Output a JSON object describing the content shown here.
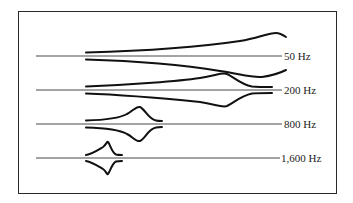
{
  "diagram": {
    "type": "traveling-wave-envelopes",
    "rows": [
      {
        "label": "50 Hz",
        "baseline_y": 56,
        "upper": "M86,52.5 C140,51 200,47 240,41 C258,38 268,33 276,33 C280,33 283,35 286,37",
        "lower": "M86,59.5 C140,61 190,66 220,71 C240,74 252,78 262,77 C270,76 278,74 286,70"
      },
      {
        "label": "200 Hz",
        "baseline_y": 90,
        "upper": "M86,86.5 C130,85 180,81 200,78 C215,76 222,72 227,74 C234,77 240,84 252,86.5 C258,87 268,87 272,87",
        "lower": "M86,93.5 C130,95 180,100 200,102 C215,104 222,108 227,106 C234,103 240,96 252,93.5 C258,93 268,93 272,93"
      },
      {
        "label": "800 Hz",
        "baseline_y": 124,
        "upper": "M86,120.5 C105,120 120,118 127,114 C133,111 136,106 140,107 C145,109 148,119 156,120.5 C158,121 160,121 162,121",
        "lower": "M86,127.5 C105,128 120,130 127,134 C133,137 136,142 140,141 C145,139 148,129 156,127.5 C158,127 160,127 162,127"
      },
      {
        "label": "1,600 Hz",
        "baseline_y": 158,
        "upper": "M86,155 C92,154 98,150 103,147 C106,145 107,141 108,142 C110,144 112,153 116,154.5 C118,155 121,155 122,155",
        "lower": "M86,161 C92,162 98,166 103,169 C106,171 107,175 108,174 C110,172 112,163 116,161.5 C118,161 121,161 122,161"
      }
    ]
  }
}
